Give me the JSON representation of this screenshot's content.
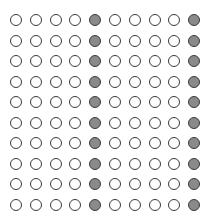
{
  "grid": {
    "rows": 10,
    "cols": 10,
    "origin_x": 16,
    "origin_y": 20,
    "pitch_x": 19.8,
    "pitch_y": 20.5,
    "filled_columns": [
      4,
      9
    ],
    "colors": {
      "background": "#ffffff",
      "outline": "#3a3a3a",
      "filled": "#8a8a8a",
      "empty": "#ffffff"
    },
    "cells": [
      [
        0,
        0,
        0,
        0,
        1,
        0,
        0,
        0,
        0,
        1
      ],
      [
        0,
        0,
        0,
        0,
        1,
        0,
        0,
        0,
        0,
        1
      ],
      [
        0,
        0,
        0,
        0,
        1,
        0,
        0,
        0,
        0,
        1
      ],
      [
        0,
        0,
        0,
        0,
        1,
        0,
        0,
        0,
        0,
        1
      ],
      [
        0,
        0,
        0,
        0,
        1,
        0,
        0,
        0,
        0,
        1
      ],
      [
        0,
        0,
        0,
        0,
        1,
        0,
        0,
        0,
        0,
        1
      ],
      [
        0,
        0,
        0,
        0,
        1,
        0,
        0,
        0,
        0,
        1
      ],
      [
        0,
        0,
        0,
        0,
        1,
        0,
        0,
        0,
        0,
        1
      ],
      [
        0,
        0,
        0,
        0,
        1,
        0,
        0,
        0,
        0,
        1
      ],
      [
        0,
        0,
        0,
        0,
        1,
        0,
        0,
        0,
        0,
        1
      ]
    ],
    "counts": {
      "filled": 20,
      "empty": 80,
      "total": 100
    }
  }
}
